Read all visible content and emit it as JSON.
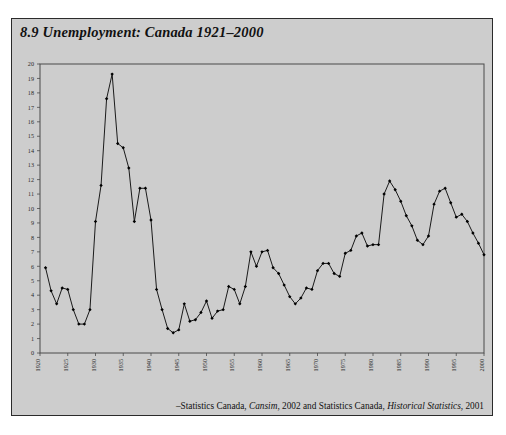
{
  "figure": {
    "number": "8.9",
    "title": "8.9 Unemployment: Canada 1921–2000",
    "source": "–Statistics Canada, Cansim, 2002 and Statistics Canada, Historical Statistics, 2001",
    "source_prefix": "–Statistics Canada, ",
    "source_italic_1": "Cansim",
    "source_mid": ", 2002 and Statistics Canada, ",
    "source_italic_2": "Historical Statistics",
    "source_suffix": ", 2001",
    "panel_color": "#cdcdcd",
    "line_color": "#1a1a1a",
    "border_color": "#2b2b2b"
  },
  "chart_data": {
    "type": "line",
    "title": "8.9 Unemployment: Canada 1921–2000",
    "xlabel": "",
    "ylabel": "",
    "xlim": [
      1920,
      2000
    ],
    "ylim": [
      0,
      20
    ],
    "grid": false,
    "legend": null,
    "marker": "filled-diamond",
    "ytick_labels": [
      "0",
      "1",
      "2",
      "3",
      "4",
      "5",
      "6",
      "7",
      "8",
      "9",
      "10",
      "11",
      "12",
      "13",
      "14",
      "15",
      "16",
      "17",
      "18",
      "19",
      "20"
    ],
    "yticks": [
      0,
      1,
      2,
      3,
      4,
      5,
      6,
      7,
      8,
      9,
      10,
      11,
      12,
      13,
      14,
      15,
      16,
      17,
      18,
      19,
      20
    ],
    "xtick_labels": [
      "1920",
      "1925",
      "1930",
      "1935",
      "1940",
      "1945",
      "1950",
      "1955",
      "1960",
      "1965",
      "1970",
      "1975",
      "1980",
      "1985",
      "1990",
      "1995",
      "2000"
    ],
    "xticks": [
      1920,
      1925,
      1930,
      1935,
      1940,
      1945,
      1950,
      1955,
      1960,
      1965,
      1970,
      1975,
      1980,
      1985,
      1990,
      1995,
      2000
    ],
    "xtick_rotation": -90,
    "series": [
      {
        "name": "Unemployment rate (%)",
        "x": [
          1921,
          1922,
          1923,
          1924,
          1925,
          1926,
          1927,
          1928,
          1929,
          1930,
          1931,
          1932,
          1933,
          1934,
          1935,
          1936,
          1937,
          1938,
          1939,
          1940,
          1941,
          1942,
          1943,
          1944,
          1945,
          1946,
          1947,
          1948,
          1949,
          1950,
          1951,
          1952,
          1953,
          1954,
          1955,
          1956,
          1957,
          1958,
          1959,
          1960,
          1961,
          1962,
          1963,
          1964,
          1965,
          1966,
          1967,
          1968,
          1969,
          1970,
          1971,
          1972,
          1973,
          1974,
          1975,
          1976,
          1977,
          1978,
          1979,
          1980,
          1981,
          1982,
          1983,
          1984,
          1985,
          1986,
          1987,
          1988,
          1989,
          1990,
          1991,
          1992,
          1993,
          1994,
          1995,
          1996,
          1997,
          1998,
          1999,
          2000
        ],
        "values": [
          5.9,
          4.3,
          3.4,
          4.5,
          4.4,
          3.0,
          2.0,
          2.0,
          3.0,
          9.1,
          11.6,
          17.6,
          19.3,
          14.5,
          14.2,
          12.8,
          9.1,
          11.4,
          11.4,
          9.2,
          4.4,
          3.0,
          1.7,
          1.4,
          1.6,
          3.4,
          2.2,
          2.3,
          2.8,
          3.6,
          2.4,
          2.9,
          3.0,
          4.6,
          4.4,
          3.4,
          4.6,
          7.0,
          6.0,
          7.0,
          7.1,
          5.9,
          5.5,
          4.7,
          3.9,
          3.4,
          3.8,
          4.5,
          4.4,
          5.7,
          6.2,
          6.2,
          5.5,
          5.3,
          6.9,
          7.1,
          8.1,
          8.3,
          7.4,
          7.5,
          7.5,
          11.0,
          11.9,
          11.3,
          10.5,
          9.5,
          8.8,
          7.8,
          7.5,
          8.1,
          10.3,
          11.2,
          11.4,
          10.4,
          9.4,
          9.6,
          9.1,
          8.3,
          7.6,
          6.8
        ]
      }
    ]
  }
}
